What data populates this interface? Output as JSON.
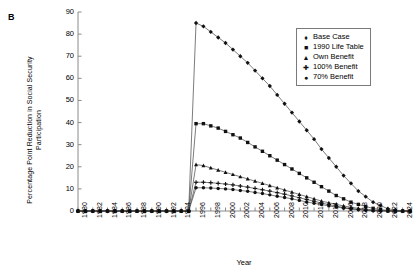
{
  "panel": {
    "label": "B"
  },
  "axes": {
    "ylabel": "Percentage Point Reduction in Social Security Participation",
    "xlabel": "Year",
    "yticks": [
      0,
      10,
      20,
      30,
      40,
      50,
      60,
      70,
      80,
      90
    ],
    "xticks": [
      1980,
      1982,
      1984,
      1986,
      1988,
      1990,
      1992,
      1994,
      1996,
      1998,
      2000,
      2002,
      2004,
      2006,
      2008,
      2010,
      2012,
      2014,
      2016,
      2018,
      2020,
      2022,
      2024
    ],
    "ylim": [
      0,
      90
    ],
    "xlim": [
      1980,
      2025
    ],
    "grid": false
  },
  "legend": {
    "position": "top-right",
    "entries": [
      {
        "label": "Base Case",
        "marker": "diamond-marker"
      },
      {
        "label": "1990 Life Table",
        "marker": "square-marker"
      },
      {
        "label": "Own Benefit",
        "marker": "triangle-marker"
      },
      {
        "label": "100% Benefit",
        "marker": "plus-marker"
      },
      {
        "label": "70% Benefit",
        "marker": "dot-marker"
      }
    ]
  },
  "chart_data": {
    "type": "line",
    "title": "",
    "xlabel": "Year",
    "ylabel": "Percentage Point Reduction in Social Security Participation",
    "ylim": [
      0,
      90
    ],
    "xlim": [
      1980,
      2025
    ],
    "grid": false,
    "legend_position": "top-right",
    "x": [
      1980,
      1981,
      1982,
      1983,
      1984,
      1985,
      1986,
      1987,
      1988,
      1989,
      1990,
      1991,
      1992,
      1993,
      1994,
      1995,
      1996,
      1997,
      1998,
      1999,
      2000,
      2001,
      2002,
      2003,
      2004,
      2005,
      2006,
      2007,
      2008,
      2009,
      2010,
      2011,
      2012,
      2013,
      2014,
      2015,
      2016,
      2017,
      2018,
      2019,
      2020,
      2021,
      2022,
      2023,
      2024,
      2025
    ],
    "series": [
      {
        "name": "Base Case",
        "marker": "diamond-marker",
        "values": [
          0,
          0,
          0,
          0,
          0,
          0,
          0,
          0,
          0,
          0,
          0,
          0,
          0,
          0,
          0,
          0,
          85,
          83.5,
          81,
          78.5,
          76,
          73,
          70,
          67,
          63.5,
          60,
          56.5,
          52.5,
          48.5,
          44.5,
          40.5,
          36.5,
          32.5,
          28,
          24,
          20,
          16,
          12.5,
          9,
          6.5,
          4,
          2.5,
          1,
          0.5,
          0,
          0
        ]
      },
      {
        "name": "1990 Life Table",
        "marker": "square-marker",
        "values": [
          0,
          0,
          0,
          0,
          0,
          0,
          0,
          0,
          0,
          0,
          0,
          0,
          0,
          0,
          0,
          0,
          39.5,
          39.5,
          38.5,
          37.5,
          36,
          34.5,
          33,
          31,
          29,
          27,
          25,
          23,
          21,
          19,
          17,
          15,
          13,
          11,
          9,
          7,
          5.5,
          4,
          3,
          2,
          1.2,
          0.6,
          0.3,
          0,
          0,
          0
        ]
      },
      {
        "name": "Own Benefit",
        "marker": "triangle-marker",
        "values": [
          0,
          0,
          0,
          0,
          0,
          0,
          0,
          0,
          0,
          0,
          0,
          0,
          0,
          0,
          0,
          0,
          21,
          20.5,
          19.5,
          18.5,
          17.5,
          16.5,
          15.5,
          14.5,
          13.5,
          12.5,
          11.5,
          10.5,
          9.5,
          8.5,
          7.5,
          6.5,
          5.5,
          4.5,
          3.7,
          3,
          2.3,
          1.7,
          1.2,
          0.8,
          0.5,
          0.3,
          0.1,
          0,
          0,
          0
        ]
      },
      {
        "name": "100% Benefit",
        "marker": "plus-marker",
        "values": [
          0,
          0,
          0,
          0,
          0,
          0,
          0,
          0,
          0,
          0,
          0,
          0,
          0,
          0,
          0,
          0,
          13,
          13,
          12.8,
          12.5,
          12.2,
          11.8,
          11.3,
          10.8,
          10.2,
          9.6,
          9,
          8.3,
          7.6,
          6.8,
          6,
          5.2,
          4.4,
          3.6,
          2.9,
          2.2,
          1.6,
          1.1,
          0.7,
          0.4,
          0.2,
          0.1,
          0,
          0,
          0,
          0
        ]
      },
      {
        "name": "70% Benefit",
        "marker": "dot-marker",
        "values": [
          0,
          0,
          0,
          0,
          0,
          0,
          0,
          0,
          0,
          0,
          0,
          0,
          0,
          0,
          0,
          0,
          10.5,
          10.5,
          10.4,
          10.2,
          10,
          9.7,
          9.3,
          8.9,
          8.4,
          7.9,
          7.3,
          6.7,
          6.1,
          5.5,
          4.8,
          4.1,
          3.5,
          2.9,
          2.3,
          1.8,
          1.3,
          0.9,
          0.6,
          0.35,
          0.15,
          0.05,
          0,
          0,
          0,
          0
        ]
      }
    ]
  }
}
